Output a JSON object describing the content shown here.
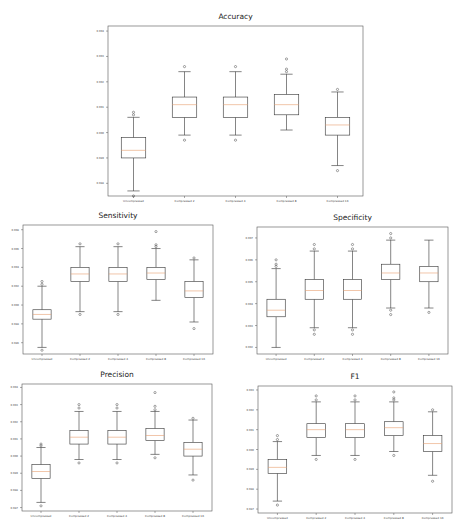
{
  "figure": {
    "background": "#ffffff",
    "frame_color": "#555555",
    "box_color": "#333333",
    "median_color": "#e8a070",
    "flier_color": "#333333"
  },
  "chart_data": [
    {
      "type": "box",
      "title": "Accuracy",
      "categories": [
        "Uncompressed",
        "Compressed 2",
        "Compressed 4",
        "Compressed 8",
        "Compressed 16"
      ],
      "yticks": [
        "0.988",
        "0.989",
        "0.990",
        "0.991",
        "0.992",
        "0.993",
        "0.994"
      ],
      "ylim": [
        0.9875,
        0.9942
      ],
      "boxes": [
        {
          "whislo": 0.9877,
          "q1": 0.989,
          "med": 0.9893,
          "q3": 0.9898,
          "whishi": 0.9906,
          "fliers": [
            0.9875,
            0.9907,
            0.9908
          ]
        },
        {
          "whislo": 0.9899,
          "q1": 0.9906,
          "med": 0.9911,
          "q3": 0.9914,
          "whishi": 0.9924,
          "fliers": [
            0.9897,
            0.9926
          ]
        },
        {
          "whislo": 0.9899,
          "q1": 0.9906,
          "med": 0.9911,
          "q3": 0.9914,
          "whishi": 0.9924,
          "fliers": [
            0.9897,
            0.9926
          ]
        },
        {
          "whislo": 0.9901,
          "q1": 0.9907,
          "med": 0.9911,
          "q3": 0.9915,
          "whishi": 0.9923,
          "fliers": [
            0.9924,
            0.9925,
            0.9929
          ]
        },
        {
          "whislo": 0.9887,
          "q1": 0.9899,
          "med": 0.9903,
          "q3": 0.9906,
          "whishi": 0.9916,
          "fliers": [
            0.9885,
            0.9917
          ]
        }
      ],
      "xlabel": "",
      "ylabel": ""
    },
    {
      "type": "box",
      "title": "Sensitivity",
      "categories": [
        "Uncompressed",
        "Compressed 2",
        "Compressed 4",
        "Compressed 8",
        "Compressed 16"
      ],
      "yticks": [
        "0.986",
        "0.988",
        "0.990",
        "0.992",
        "0.994",
        "0.996",
        "0.998"
      ],
      "ylim": [
        0.9848,
        0.9985
      ],
      "boxes": [
        {
          "whislo": 0.9855,
          "q1": 0.9885,
          "med": 0.989,
          "q3": 0.9895,
          "whishi": 0.992,
          "fliers": [
            0.9852,
            0.9922,
            0.9925
          ]
        },
        {
          "whislo": 0.9893,
          "q1": 0.9925,
          "med": 0.9933,
          "q3": 0.994,
          "whishi": 0.9962,
          "fliers": [
            0.989,
            0.9965
          ]
        },
        {
          "whislo": 0.9893,
          "q1": 0.9925,
          "med": 0.9933,
          "q3": 0.994,
          "whishi": 0.9962,
          "fliers": [
            0.989,
            0.9965
          ]
        },
        {
          "whislo": 0.9905,
          "q1": 0.9927,
          "med": 0.9934,
          "q3": 0.994,
          "whishi": 0.996,
          "fliers": [
            0.9962,
            0.9964,
            0.9978
          ]
        },
        {
          "whislo": 0.9882,
          "q1": 0.9908,
          "med": 0.9915,
          "q3": 0.9925,
          "whishi": 0.9948,
          "fliers": [
            0.9875,
            0.995
          ]
        }
      ],
      "xlabel": "",
      "ylabel": ""
    },
    {
      "type": "box",
      "title": "Specificity",
      "categories": [
        "Uncompressed",
        "Compressed 2",
        "Compressed 4",
        "Compressed 8",
        "Compressed 16"
      ],
      "yticks": [
        "0.992",
        "0.993",
        "0.994",
        "0.995",
        "0.996",
        "0.997"
      ],
      "ylim": [
        0.9917,
        0.9975
      ],
      "boxes": [
        {
          "whislo": 0.992,
          "q1": 0.9934,
          "med": 0.9937,
          "q3": 0.9942,
          "whishi": 0.9956,
          "fliers": [
            0.9957,
            0.9958,
            0.996
          ]
        },
        {
          "whislo": 0.9929,
          "q1": 0.9942,
          "med": 0.9946,
          "q3": 0.9951,
          "whishi": 0.9964,
          "fliers": [
            0.9926,
            0.9928,
            0.9965,
            0.9967
          ]
        },
        {
          "whislo": 0.9929,
          "q1": 0.9942,
          "med": 0.9946,
          "q3": 0.9951,
          "whishi": 0.9964,
          "fliers": [
            0.9926,
            0.9928,
            0.9965,
            0.9967
          ]
        },
        {
          "whislo": 0.9938,
          "q1": 0.9951,
          "med": 0.9954,
          "q3": 0.9958,
          "whishi": 0.9969,
          "fliers": [
            0.9935,
            0.9937,
            0.997,
            0.9972
          ]
        },
        {
          "whislo": 0.9938,
          "q1": 0.995,
          "med": 0.9954,
          "q3": 0.9957,
          "whishi": 0.9969,
          "fliers": [
            0.9936
          ]
        }
      ],
      "xlabel": "",
      "ylabel": ""
    },
    {
      "type": "box",
      "title": "Precision",
      "categories": [
        "Uncompressed",
        "Compressed 2",
        "Compressed 4",
        "Compressed 8",
        "Compressed 16"
      ],
      "yticks": [
        "0.987",
        "0.988",
        "0.989",
        "0.990",
        "0.991",
        "0.992",
        "0.993",
        "0.994"
      ],
      "ylim": [
        0.9868,
        0.9942
      ],
      "boxes": [
        {
          "whislo": 0.9873,
          "q1": 0.9887,
          "med": 0.9891,
          "q3": 0.9895,
          "whishi": 0.9905,
          "fliers": [
            0.9871,
            0.9906,
            0.9907
          ]
        },
        {
          "whislo": 0.9898,
          "q1": 0.9907,
          "med": 0.9911,
          "q3": 0.9915,
          "whishi": 0.9926,
          "fliers": [
            0.9896,
            0.9928,
            0.993
          ]
        },
        {
          "whislo": 0.9898,
          "q1": 0.9907,
          "med": 0.9911,
          "q3": 0.9915,
          "whishi": 0.9926,
          "fliers": [
            0.9896,
            0.9928,
            0.993
          ]
        },
        {
          "whislo": 0.9901,
          "q1": 0.9909,
          "med": 0.9912,
          "q3": 0.9916,
          "whishi": 0.9926,
          "fliers": [
            0.9899,
            0.9927,
            0.9929,
            0.9937
          ]
        },
        {
          "whislo": 0.9889,
          "q1": 0.99,
          "med": 0.9904,
          "q3": 0.9908,
          "whishi": 0.9921,
          "fliers": [
            0.9886,
            0.9922
          ]
        }
      ],
      "xlabel": "",
      "ylabel": ""
    },
    {
      "type": "box",
      "title": "F1",
      "categories": [
        "Uncompressed",
        "Compressed 2",
        "Compressed 4",
        "Compressed 8",
        "Compressed 16"
      ],
      "yticks": [
        "0.987",
        "0.988",
        "0.989",
        "0.990",
        "0.991",
        "0.992",
        "0.993"
      ],
      "ylim": [
        0.9868,
        0.9932
      ],
      "boxes": [
        {
          "whislo": 0.9874,
          "q1": 0.9888,
          "med": 0.9891,
          "q3": 0.9895,
          "whishi": 0.9904,
          "fliers": [
            0.9872,
            0.9905,
            0.9907
          ]
        },
        {
          "whislo": 0.9897,
          "q1": 0.9906,
          "med": 0.991,
          "q3": 0.9913,
          "whishi": 0.9924,
          "fliers": [
            0.9895,
            0.9925,
            0.9927
          ]
        },
        {
          "whislo": 0.9897,
          "q1": 0.9906,
          "med": 0.991,
          "q3": 0.9913,
          "whishi": 0.9924,
          "fliers": [
            0.9895,
            0.9925,
            0.9927
          ]
        },
        {
          "whislo": 0.9899,
          "q1": 0.9907,
          "med": 0.9911,
          "q3": 0.9914,
          "whishi": 0.9924,
          "fliers": [
            0.9897,
            0.9925,
            0.9926,
            0.9929
          ]
        },
        {
          "whislo": 0.9887,
          "q1": 0.9899,
          "med": 0.9903,
          "q3": 0.9907,
          "whishi": 0.9919,
          "fliers": [
            0.9884,
            0.992
          ]
        }
      ],
      "xlabel": "",
      "ylabel": ""
    }
  ]
}
